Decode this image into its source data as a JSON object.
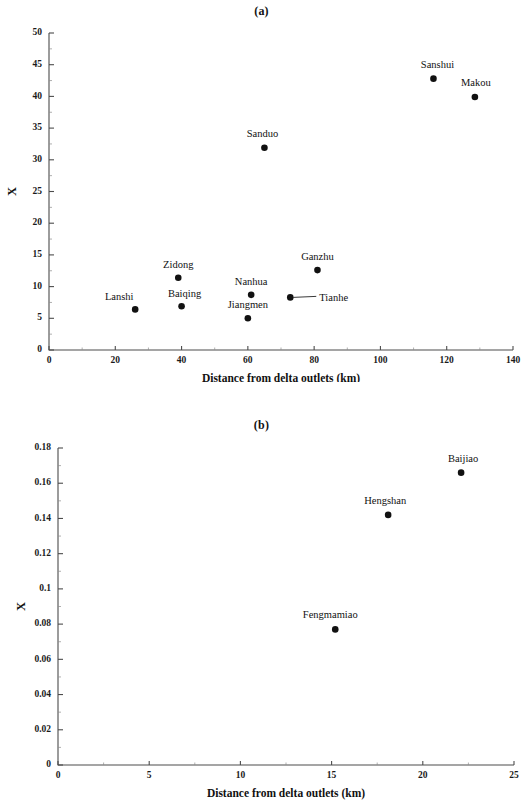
{
  "figure": {
    "panel_a_title": "(a)",
    "panel_b_title": "(b)"
  },
  "chart_data": [
    {
      "type": "scatter",
      "title": "(a)",
      "xlabel": "Distance from delta outlets (km)",
      "ylabel": "X",
      "xlim": [
        0,
        140
      ],
      "ylim": [
        0,
        50
      ],
      "xticks": [
        0,
        20,
        40,
        60,
        80,
        100,
        120,
        140
      ],
      "xticklabels": [
        "0",
        "20",
        "40",
        "60",
        "80",
        "100",
        "120",
        "140"
      ],
      "yticks": [
        0,
        5,
        10,
        15,
        20,
        25,
        30,
        35,
        40,
        45,
        50
      ],
      "yticklabels": [
        "0",
        "5",
        "10",
        "15",
        "20",
        "25",
        "30",
        "35",
        "40",
        "45",
        "50"
      ],
      "grid": false,
      "legend": "none",
      "points": [
        {
          "label": "Lanshi",
          "x": 26.0,
          "y": 6.4,
          "label_dx": -16,
          "label_dy": -9,
          "anchor": "middle",
          "leader": false
        },
        {
          "label": "Zidong",
          "x": 39.0,
          "y": 11.4,
          "label_dx": 0,
          "label_dy": -10,
          "anchor": "middle",
          "leader": false
        },
        {
          "label": "Baiqing",
          "x": 40.0,
          "y": 6.9,
          "label_dx": 3,
          "label_dy": -9,
          "anchor": "middle",
          "leader": false
        },
        {
          "label": "Jiangmen",
          "x": 60.0,
          "y": 5.0,
          "label_dx": 0,
          "label_dy": -10,
          "anchor": "middle",
          "leader": false
        },
        {
          "label": "Nanhua",
          "x": 61.0,
          "y": 8.7,
          "label_dx": 0,
          "label_dy": -10,
          "anchor": "middle",
          "leader": false
        },
        {
          "label": "Sanduo",
          "x": 65.0,
          "y": 31.9,
          "label_dx": -2,
          "label_dy": -11,
          "anchor": "middle",
          "leader": false
        },
        {
          "label": "Tianhe",
          "x": 72.8,
          "y": 8.3,
          "label_dx": 29,
          "label_dy": 4,
          "anchor": "start",
          "leader": true
        },
        {
          "label": "Ganzhu",
          "x": 81.0,
          "y": 12.6,
          "label_dx": 0,
          "label_dy": -10,
          "anchor": "middle",
          "leader": false
        },
        {
          "label": "Sanshui",
          "x": 116.0,
          "y": 42.8,
          "label_dx": 4,
          "label_dy": -11,
          "anchor": "middle",
          "leader": false
        },
        {
          "label": "Makou",
          "x": 128.5,
          "y": 39.9,
          "label_dx": 1,
          "label_dy": -11,
          "anchor": "middle",
          "leader": false
        }
      ]
    },
    {
      "type": "scatter",
      "title": "(b)",
      "xlabel": "Distance from delta outlets (km)",
      "ylabel": "X",
      "xlim": [
        0,
        25
      ],
      "ylim": [
        0,
        0.18
      ],
      "xticks": [
        0,
        5,
        10,
        15,
        20,
        25
      ],
      "xticklabels": [
        "0",
        "5",
        "10",
        "15",
        "20",
        "25"
      ],
      "yticks": [
        0,
        0.02,
        0.04,
        0.06,
        0.08,
        0.1,
        0.12,
        0.14,
        0.16,
        0.18
      ],
      "yticklabels": [
        "0",
        "0.02",
        "0.04",
        "0.06",
        "0.08",
        "0.1",
        "0.12",
        "0.14",
        "0.16",
        "0.18"
      ],
      "grid": false,
      "legend": "none",
      "points": [
        {
          "label": "Fengmamiao",
          "x": 15.2,
          "y": 0.077,
          "label_dx": -5,
          "label_dy": -11,
          "anchor": "middle",
          "leader": false
        },
        {
          "label": "Hengshan",
          "x": 18.1,
          "y": 0.142,
          "label_dx": -3,
          "label_dy": -11,
          "anchor": "middle",
          "leader": false
        },
        {
          "label": "Baijiao",
          "x": 22.1,
          "y": 0.166,
          "label_dx": 2,
          "label_dy": -11,
          "anchor": "middle",
          "leader": false
        }
      ]
    }
  ]
}
